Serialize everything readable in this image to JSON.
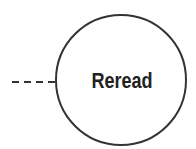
{
  "diagram": {
    "node": {
      "label": "Reread",
      "shape": "circle",
      "stroke_color": "#333333"
    },
    "connector": {
      "style": "dashed",
      "direction": "from-left"
    }
  }
}
